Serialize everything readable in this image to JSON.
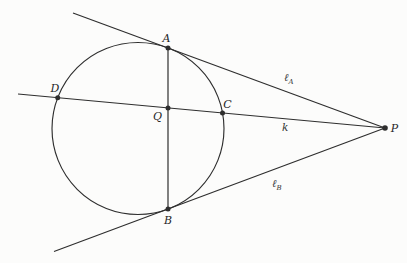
{
  "figure": {
    "points": {
      "A": "A",
      "B": "B",
      "C": "C",
      "D": "D",
      "Q": "Q",
      "P": "P"
    },
    "lines": {
      "tangent_a": {
        "symbol": "ℓ",
        "subscript": "A"
      },
      "secant": {
        "symbol": "k",
        "subscript": ""
      },
      "tangent_b": {
        "symbol": "ℓ",
        "subscript": "B"
      }
    },
    "colors": {
      "ink": "#2e2e2e",
      "paper": "#fcfcfb"
    }
  }
}
